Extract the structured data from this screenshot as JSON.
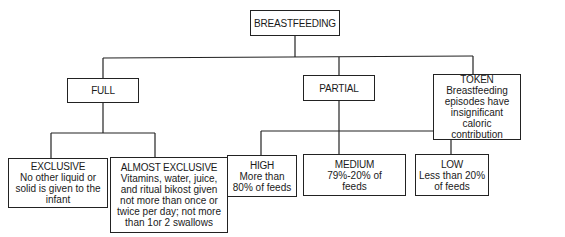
{
  "diagram": {
    "type": "tree",
    "root": {
      "title": "BREASTFEEDING"
    },
    "level1": [
      {
        "id": "full",
        "title": "FULL"
      },
      {
        "id": "partial",
        "title": "PARTIAL"
      },
      {
        "id": "token",
        "title": "TOKEN",
        "desc": "Breastfeeding episodes have insignificant caloric contribution"
      }
    ],
    "full_children": [
      {
        "id": "exclusive",
        "title": "EXCLUSIVE",
        "desc": "No other liquid or solid is given to the infant"
      },
      {
        "id": "almost_exclusive",
        "title": "ALMOST EXCLUSIVE",
        "desc": "Vitamins, water, juice, and ritual bikost given not more than once or twice per day; not more than 1or 2 swallows"
      }
    ],
    "partial_children": [
      {
        "id": "high",
        "title": "HIGH",
        "desc": "More than 80% of feeds"
      },
      {
        "id": "medium",
        "title": "MEDIUM",
        "desc": "79%-20% of feeds"
      },
      {
        "id": "low",
        "title": "LOW",
        "desc": "Less than 20% of feeds"
      }
    ]
  }
}
